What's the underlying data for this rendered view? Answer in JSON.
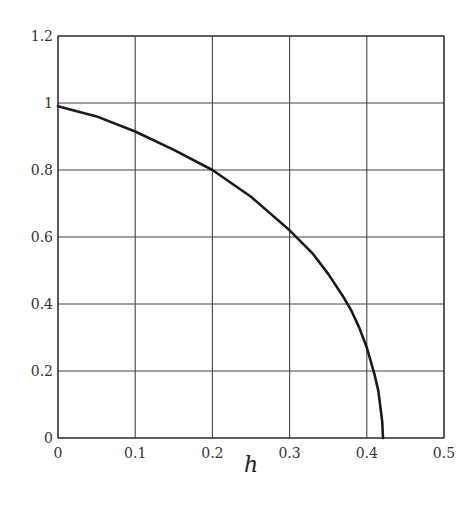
{
  "chart_data": {
    "type": "line",
    "title": "",
    "xlabel": "h",
    "ylabel": "",
    "xlim": [
      0,
      0.5
    ],
    "ylim": [
      0,
      1.2
    ],
    "grid": true,
    "xticks": [
      "0",
      "0.1",
      "0.2",
      "0.3",
      "0.4",
      "0.5"
    ],
    "yticks": [
      "0",
      "0.2",
      "0.4",
      "0.6",
      "0.8",
      "1",
      "1.2"
    ],
    "series": [
      {
        "name": "curve",
        "color": "#1a1a1a",
        "x": [
          0,
          0.05,
          0.1,
          0.15,
          0.2,
          0.25,
          0.3,
          0.33,
          0.35,
          0.37,
          0.38,
          0.39,
          0.4,
          0.41,
          0.415,
          0.42,
          0.421
        ],
        "y": [
          0.99,
          0.96,
          0.915,
          0.86,
          0.8,
          0.72,
          0.62,
          0.55,
          0.49,
          0.42,
          0.38,
          0.33,
          0.27,
          0.19,
          0.14,
          0.05,
          0.0
        ]
      }
    ]
  }
}
